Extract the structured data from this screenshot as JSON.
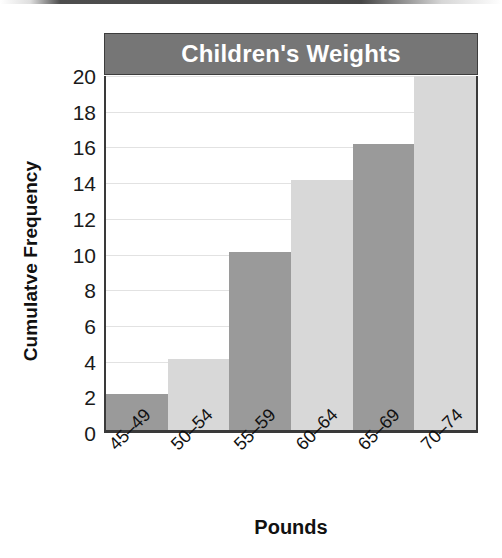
{
  "chart_data": {
    "type": "bar",
    "title": "Children's Weights",
    "xlabel": "Pounds",
    "ylabel": "Cumulatve Frequency",
    "categories": [
      "45–49",
      "50–54",
      "55–59",
      "60–64",
      "65–69",
      "70–74"
    ],
    "values": [
      2,
      4,
      10,
      14,
      16,
      20
    ],
    "ylim": [
      0,
      20
    ],
    "ytick_step": 2,
    "ytick_labels": [
      "20",
      "18",
      "16",
      "14",
      "12",
      "10",
      "8",
      "6",
      "4",
      "2",
      "0"
    ],
    "ytick_values": [
      20,
      18,
      16,
      14,
      12,
      10,
      8,
      6,
      4,
      2,
      0
    ],
    "grid": true,
    "legend": "none",
    "bar_colors": [
      "#9a9a9a",
      "#d8d8d8",
      "#9a9a9a",
      "#d8d8d8",
      "#9a9a9a",
      "#d8d8d8"
    ],
    "series": [
      {
        "name": "Cumulatve Frequency",
        "values": [
          2,
          4,
          10,
          14,
          16,
          20
        ]
      }
    ]
  },
  "style": {
    "title_bar_color": "#767676",
    "title_text_color": "#ffffff",
    "bar_dark": "#9a9a9a",
    "bar_light": "#d8d8d8",
    "axis_color": "#3a3a3a",
    "gridline_color": "#e2e2e2",
    "background": "#ffffff"
  }
}
